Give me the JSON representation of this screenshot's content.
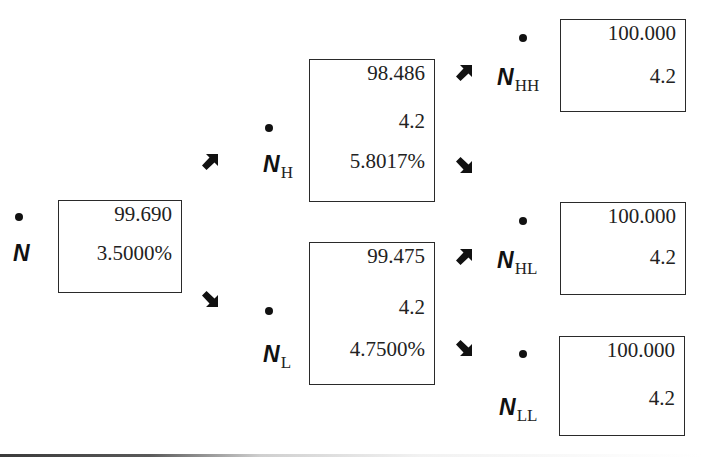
{
  "diagram": {
    "type": "binomial-tree",
    "nodes": {
      "N": {
        "symbol": "N",
        "subscript": "",
        "values": [
          "99.690",
          "3.5000%"
        ]
      },
      "NH": {
        "symbol": "N",
        "subscript": "H",
        "values": [
          "98.486",
          "4.2",
          "5.8017%"
        ]
      },
      "NL": {
        "symbol": "N",
        "subscript": "L",
        "values": [
          "99.475",
          "4.2",
          "4.7500%"
        ]
      },
      "NHH": {
        "symbol": "N",
        "subscript": "HH",
        "values": [
          "100.000",
          "4.2"
        ]
      },
      "NHL": {
        "symbol": "N",
        "subscript": "HL",
        "values": [
          "100.000",
          "4.2"
        ]
      },
      "NLL": {
        "symbol": "N",
        "subscript": "LL",
        "values": [
          "100.000",
          "4.2"
        ]
      }
    },
    "edges": [
      {
        "from": "N",
        "to": "NH",
        "direction": "up"
      },
      {
        "from": "N",
        "to": "NL",
        "direction": "down"
      },
      {
        "from": "NH",
        "to": "NHH",
        "direction": "up"
      },
      {
        "from": "NH",
        "to": "NHL",
        "direction": "down"
      },
      {
        "from": "NL",
        "to": "NHL",
        "direction": "up"
      },
      {
        "from": "NL",
        "to": "NLL",
        "direction": "down"
      }
    ],
    "colors": {
      "ink": "#111111",
      "box_border": "#2a2a2a",
      "background": "#ffffff"
    }
  }
}
